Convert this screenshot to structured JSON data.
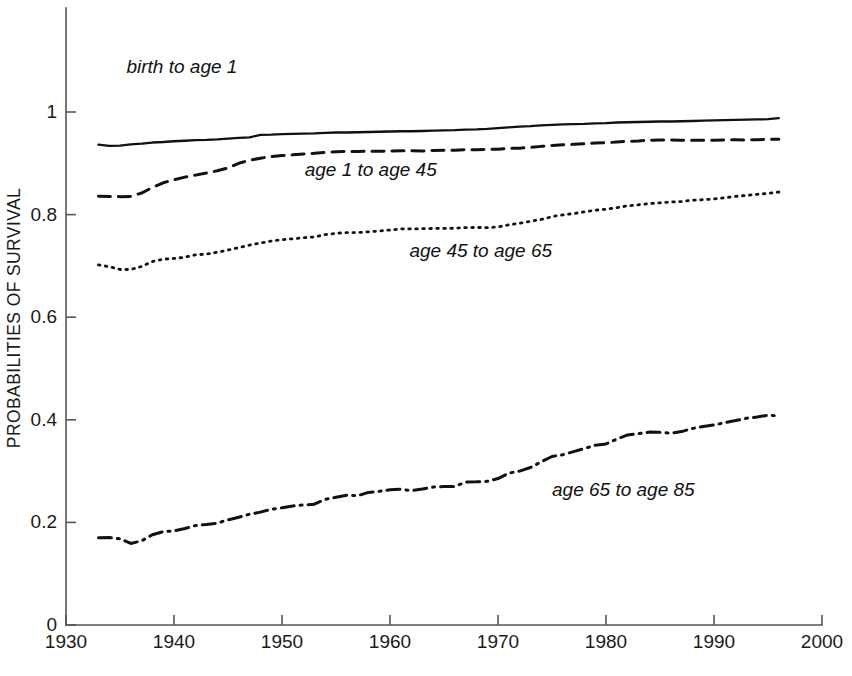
{
  "chart_data": {
    "type": "line",
    "title": "",
    "xlabel": "",
    "ylabel": "PROBABILITIES OF SURVIVAL",
    "xlim": [
      1930,
      2000
    ],
    "ylim": [
      0,
      1.2
    ],
    "xticks": [
      1930,
      1940,
      1950,
      1960,
      1970,
      1980,
      1990,
      2000
    ],
    "xticklabels": [
      "1930",
      "1940",
      "1950",
      "1960",
      "1970",
      "1980",
      "1990",
      "2000"
    ],
    "yticks": [
      0,
      0.2,
      0.4,
      0.6,
      0.8,
      1
    ],
    "yticklabels": [
      "0",
      "0.2",
      "0.4",
      "0.6",
      "0.8",
      "1"
    ],
    "grid": false,
    "legend_position": "inline-annotations",
    "x": [
      1933,
      1934,
      1935,
      1936,
      1937,
      1938,
      1939,
      1940,
      1941,
      1942,
      1943,
      1944,
      1945,
      1946,
      1947,
      1948,
      1949,
      1950,
      1951,
      1952,
      1953,
      1954,
      1955,
      1956,
      1957,
      1958,
      1959,
      1960,
      1961,
      1962,
      1963,
      1964,
      1965,
      1966,
      1967,
      1968,
      1969,
      1970,
      1971,
      1972,
      1973,
      1974,
      1975,
      1976,
      1977,
      1978,
      1979,
      1980,
      1981,
      1982,
      1983,
      1984,
      1985,
      1986,
      1987,
      1988,
      1989,
      1990,
      1991,
      1992,
      1993,
      1994,
      1995,
      1996
    ],
    "series": [
      {
        "name": "birth to age 1",
        "style": "solid",
        "label_text": "birth to age 1",
        "label_x": 1935.6,
        "label_y": 1.085,
        "values": [
          0.9365,
          0.934,
          0.9345,
          0.937,
          0.9385,
          0.9405,
          0.9415,
          0.943,
          0.944,
          0.945,
          0.9455,
          0.9465,
          0.948,
          0.9495,
          0.9505,
          0.9555,
          0.956,
          0.957,
          0.9575,
          0.958,
          0.9585,
          0.9595,
          0.96,
          0.96,
          0.9605,
          0.961,
          0.9615,
          0.962,
          0.9625,
          0.9625,
          0.963,
          0.9635,
          0.964,
          0.9645,
          0.9655,
          0.966,
          0.967,
          0.9685,
          0.97,
          0.9715,
          0.9725,
          0.974,
          0.975,
          0.976,
          0.9765,
          0.977,
          0.978,
          0.9785,
          0.9795,
          0.98,
          0.9805,
          0.981,
          0.9815,
          0.9815,
          0.982,
          0.9825,
          0.983,
          0.9835,
          0.984,
          0.9845,
          0.985,
          0.9855,
          0.986,
          0.988
        ]
      },
      {
        "name": "age 1 to age 45",
        "style": "dashed",
        "label_text": "age 1 to age 45",
        "label_x": 1952.1,
        "label_y": 0.885,
        "values": [
          0.836,
          0.8355,
          0.835,
          0.8355,
          0.842,
          0.853,
          0.862,
          0.868,
          0.873,
          0.877,
          0.881,
          0.8855,
          0.891,
          0.9,
          0.906,
          0.91,
          0.913,
          0.915,
          0.9165,
          0.918,
          0.9195,
          0.9215,
          0.9225,
          0.923,
          0.923,
          0.9235,
          0.9235,
          0.924,
          0.9245,
          0.9245,
          0.924,
          0.925,
          0.9255,
          0.9255,
          0.9265,
          0.9265,
          0.927,
          0.9275,
          0.929,
          0.9295,
          0.931,
          0.933,
          0.9345,
          0.936,
          0.937,
          0.938,
          0.9395,
          0.94,
          0.9415,
          0.943,
          0.9435,
          0.945,
          0.9455,
          0.9455,
          0.945,
          0.945,
          0.945,
          0.945,
          0.9455,
          0.946,
          0.9455,
          0.946,
          0.9465,
          0.947
        ]
      },
      {
        "name": "age 45 to age 65",
        "style": "dotted",
        "label_text": "age 45  to age 65",
        "label_x": 1961.8,
        "label_y": 0.727,
        "values": [
          0.702,
          0.6985,
          0.693,
          0.693,
          0.699,
          0.7085,
          0.713,
          0.7145,
          0.717,
          0.7215,
          0.723,
          0.7265,
          0.731,
          0.7355,
          0.7405,
          0.7445,
          0.7485,
          0.751,
          0.753,
          0.755,
          0.7565,
          0.761,
          0.7635,
          0.765,
          0.765,
          0.7665,
          0.768,
          0.77,
          0.772,
          0.772,
          0.7725,
          0.773,
          0.773,
          0.7735,
          0.7745,
          0.775,
          0.7745,
          0.776,
          0.78,
          0.783,
          0.787,
          0.7905,
          0.796,
          0.7995,
          0.802,
          0.8055,
          0.8085,
          0.8105,
          0.8135,
          0.817,
          0.819,
          0.8215,
          0.823,
          0.8245,
          0.8255,
          0.828,
          0.829,
          0.8305,
          0.833,
          0.8355,
          0.8375,
          0.8395,
          0.8415,
          0.844
        ]
      },
      {
        "name": "age 65 to age 85",
        "style": "dashdot",
        "label_text": "age 65  to age 85",
        "label_x": 1975.0,
        "label_y": 0.262,
        "values": [
          0.17,
          0.1705,
          0.168,
          0.159,
          0.164,
          0.176,
          0.182,
          0.1835,
          0.188,
          0.194,
          0.196,
          0.1985,
          0.205,
          0.21,
          0.216,
          0.22,
          0.2255,
          0.2285,
          0.232,
          0.234,
          0.2355,
          0.245,
          0.249,
          0.253,
          0.252,
          0.2585,
          0.2605,
          0.2635,
          0.2645,
          0.262,
          0.265,
          0.269,
          0.27,
          0.27,
          0.2785,
          0.279,
          0.28,
          0.2855,
          0.296,
          0.3,
          0.307,
          0.318,
          0.3285,
          0.332,
          0.338,
          0.344,
          0.3505,
          0.353,
          0.3625,
          0.3705,
          0.373,
          0.376,
          0.3755,
          0.374,
          0.377,
          0.383,
          0.387,
          0.39,
          0.3945,
          0.3985,
          0.403,
          0.4055,
          0.409,
          0.4075
        ]
      }
    ]
  }
}
